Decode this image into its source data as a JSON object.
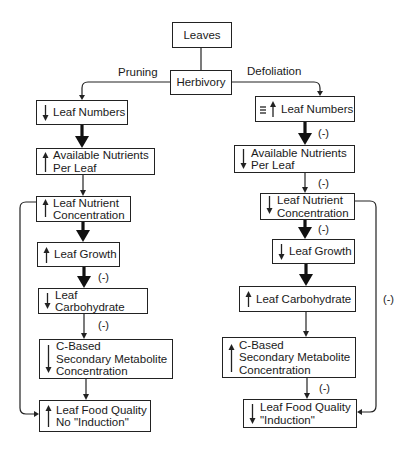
{
  "diagram": {
    "root": "Leaves",
    "hub": "Herbivory",
    "branches": {
      "left": {
        "label": "Pruning",
        "nodes": [
          {
            "text_lines": [
              "Leaf Numbers"
            ],
            "direction": "down"
          },
          {
            "text_lines": [
              "Available Nutrients",
              "Per Leaf"
            ],
            "direction": "up"
          },
          {
            "text_lines": [
              "Leaf Nutrient",
              "Concentration"
            ],
            "direction": "up"
          },
          {
            "text_lines": [
              "Leaf Growth"
            ],
            "direction": "up"
          },
          {
            "text_lines": [
              "Leaf Carbohydrate"
            ],
            "direction": "down"
          },
          {
            "text_lines": [
              "C-Based",
              "Secondary Metabolite",
              "Concentration"
            ],
            "direction": "down"
          },
          {
            "text_lines": [
              "Leaf Food Quality",
              "No \"Induction\""
            ],
            "direction": "up"
          }
        ],
        "edge_labels": [
          "",
          "",
          "",
          "(-)",
          "(-)",
          ""
        ]
      },
      "right": {
        "label": "Defoliation",
        "nodes": [
          {
            "text_lines": [
              "Leaf Numbers"
            ],
            "direction": "equal-or-up"
          },
          {
            "text_lines": [
              "Available Nutrients",
              "Per Leaf"
            ],
            "direction": "down"
          },
          {
            "text_lines": [
              "Leaf Nutrient",
              "Concentration"
            ],
            "direction": "down"
          },
          {
            "text_lines": [
              "Leaf Growth"
            ],
            "direction": "down"
          },
          {
            "text_lines": [
              "Leaf Carbohydrate"
            ],
            "direction": "up"
          },
          {
            "text_lines": [
              "C-Based",
              "Secondary Metabolite",
              "Concentration"
            ],
            "direction": "up"
          },
          {
            "text_lines": [
              "Leaf Food Quality",
              "\"Induction\""
            ],
            "direction": "down"
          }
        ],
        "edge_labels": [
          "(-)",
          "(-)",
          "(-)",
          "",
          "",
          "(-)"
        ],
        "feedback_label": "(-)"
      }
    }
  },
  "text": {
    "leaves": "Leaves",
    "herbivory": "Herbivory",
    "pruning": "Pruning",
    "defoliation": "Defoliation",
    "neg": "(-)",
    "l1": "Leaf Numbers",
    "l2a": "Available Nutrients",
    "l2b": "Per Leaf",
    "l3a": "Leaf Nutrient",
    "l3b": "Concentration",
    "l4": "Leaf Growth",
    "l5": "Leaf Carbohydrate",
    "l6a": "C-Based",
    "l6b": "Secondary Metabolite",
    "l6c": "Concentration",
    "l7a": "Leaf Food Quality",
    "l7b": "No \"Induction\"",
    "r1": "Leaf Numbers",
    "r2a": "Available Nutrients",
    "r2b": "Per Leaf",
    "r3a": "Leaf Nutrient",
    "r3b": "Concentration",
    "r4": "Leaf Growth",
    "r5": "Leaf Carbohydrate",
    "r6a": "C-Based",
    "r6b": "Secondary Metabolite",
    "r6c": "Concentration",
    "r7a": "Leaf Food Quality",
    "r7b": "\"Induction\""
  }
}
